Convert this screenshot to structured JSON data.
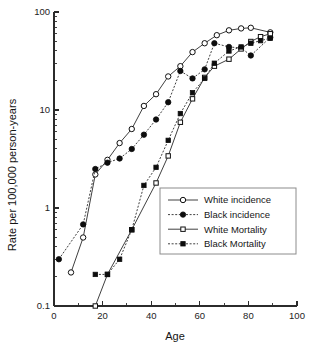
{
  "chart_data": {
    "type": "line",
    "title": "",
    "xlabel": "Age",
    "ylabel": "Rate per 100,000 person-years",
    "xlim": [
      0,
      100
    ],
    "ylim": [
      0.1,
      100
    ],
    "yscale": "log",
    "xscale": "linear",
    "grid": false,
    "legend_position": "lower-right",
    "x_ticks": [
      0,
      20,
      40,
      60,
      80,
      100
    ],
    "x_tick_labels": [
      "0",
      "20",
      "40",
      "60",
      "80",
      "100"
    ],
    "x_minor_ticks": [
      10,
      30,
      50,
      70,
      90
    ],
    "y_ticks": [
      0.1,
      1,
      10,
      100
    ],
    "y_tick_labels": [
      "0.1",
      "1",
      "10",
      "100"
    ],
    "series": [
      {
        "name": "White incidence",
        "marker": "open-circle",
        "line": "solid",
        "points": [
          {
            "x": 7,
            "y": 0.22
          },
          {
            "x": 12,
            "y": 0.5
          },
          {
            "x": 17,
            "y": 2.2
          },
          {
            "x": 22,
            "y": 3.1
          },
          {
            "x": 27,
            "y": 4.6
          },
          {
            "x": 32,
            "y": 6.4
          },
          {
            "x": 37,
            "y": 11.0
          },
          {
            "x": 42,
            "y": 14.5
          },
          {
            "x": 47,
            "y": 22.0
          },
          {
            "x": 52,
            "y": 28.0
          },
          {
            "x": 57,
            "y": 39.0
          },
          {
            "x": 62,
            "y": 48.0
          },
          {
            "x": 67,
            "y": 58.0
          },
          {
            "x": 72,
            "y": 65.0
          },
          {
            "x": 77,
            "y": 68.0
          },
          {
            "x": 81,
            "y": 69.0
          },
          {
            "x": 89,
            "y": 62.0
          }
        ]
      },
      {
        "name": "Black incidence",
        "marker": "filled-circle",
        "line": "dashed",
        "points": [
          {
            "x": 2,
            "y": 0.3
          },
          {
            "x": 12,
            "y": 0.68
          },
          {
            "x": 17,
            "y": 2.5
          },
          {
            "x": 22,
            "y": 2.9
          },
          {
            "x": 27,
            "y": 3.2
          },
          {
            "x": 32,
            "y": 4.0
          },
          {
            "x": 37,
            "y": 5.6
          },
          {
            "x": 42,
            "y": 8.0
          },
          {
            "x": 47,
            "y": 12.0
          },
          {
            "x": 52,
            "y": 25.0
          },
          {
            "x": 57,
            "y": 21.0
          },
          {
            "x": 62,
            "y": 26.0
          },
          {
            "x": 66,
            "y": 48.0
          },
          {
            "x": 72,
            "y": 44.0
          },
          {
            "x": 77,
            "y": 43.0
          },
          {
            "x": 81,
            "y": 36.0
          },
          {
            "x": 89,
            "y": 55.0
          }
        ]
      },
      {
        "name": "White Mortality",
        "marker": "open-square",
        "line": "solid",
        "points": [
          {
            "x": 17,
            "y": 0.1
          },
          {
            "x": 22,
            "y": 0.21
          },
          {
            "x": 32,
            "y": 0.6
          },
          {
            "x": 42,
            "y": 1.8
          },
          {
            "x": 47,
            "y": 3.4
          },
          {
            "x": 52,
            "y": 7.5
          },
          {
            "x": 57,
            "y": 13.0
          },
          {
            "x": 62,
            "y": 21.5
          },
          {
            "x": 66,
            "y": 28.0
          },
          {
            "x": 72,
            "y": 33.0
          },
          {
            "x": 77,
            "y": 42.0
          },
          {
            "x": 81,
            "y": 50.0
          },
          {
            "x": 85,
            "y": 56.0
          },
          {
            "x": 89,
            "y": 60.0
          }
        ]
      },
      {
        "name": "Black Mortality",
        "marker": "filled-square",
        "line": "dashed",
        "points": [
          {
            "x": 17,
            "y": 0.21
          },
          {
            "x": 22,
            "y": 0.21
          },
          {
            "x": 27,
            "y": 0.3
          },
          {
            "x": 32,
            "y": 0.6
          },
          {
            "x": 37,
            "y": 1.7
          },
          {
            "x": 42,
            "y": 2.6
          },
          {
            "x": 47,
            "y": 4.9
          },
          {
            "x": 52,
            "y": 9.2
          },
          {
            "x": 57,
            "y": 15.0
          },
          {
            "x": 62,
            "y": 21.0
          },
          {
            "x": 66,
            "y": 30.0
          },
          {
            "x": 72,
            "y": 40.0
          },
          {
            "x": 77,
            "y": 44.0
          },
          {
            "x": 81,
            "y": 48.0
          },
          {
            "x": 85,
            "y": 51.0
          },
          {
            "x": 89,
            "y": 54.0
          }
        ]
      }
    ]
  },
  "legend": {
    "entries": [
      {
        "label": "White incidence",
        "marker": "open-circle",
        "line": "solid"
      },
      {
        "label": "Black incidence",
        "marker": "filled-circle",
        "line": "dashed"
      },
      {
        "label": "White Mortality",
        "marker": "open-square",
        "line": "solid"
      },
      {
        "label": "Black Mortality",
        "marker": "filled-square",
        "line": "dashed"
      }
    ]
  }
}
